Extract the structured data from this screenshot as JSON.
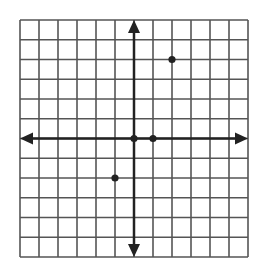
{
  "chart_data": {
    "type": "scatter",
    "title": "",
    "xlabel": "",
    "ylabel": "",
    "xlim": [
      -6,
      6
    ],
    "ylim": [
      -6,
      6
    ],
    "grid": true,
    "grid_step": 1,
    "axes_with_arrows": true,
    "points": [
      {
        "x": 0,
        "y": 0
      },
      {
        "x": 1,
        "y": 0
      },
      {
        "x": 2,
        "y": 4
      },
      {
        "x": -1,
        "y": -2
      }
    ]
  },
  "colors": {
    "grid": "#555555",
    "axis": "#222222",
    "point": "#222222",
    "background": "#ffffff"
  },
  "layout": {
    "left": 20,
    "top": 20,
    "right": 248,
    "bottom": 257
  }
}
